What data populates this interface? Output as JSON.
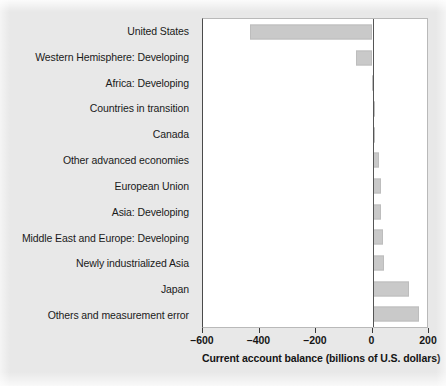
{
  "figure": {
    "background_color": "#e8e8e8",
    "plot_background_color": "#ffffff",
    "bar_color": "#c9c9c9",
    "axis_color": "#4a4a4a"
  },
  "chart_data": {
    "type": "bar",
    "orientation": "horizontal",
    "title": "",
    "xlabel": "Current account balance (billions of U.S. dollars)",
    "ylabel": "",
    "xlim": [
      -600,
      200
    ],
    "xticks": [
      -600,
      -400,
      -200,
      0,
      200
    ],
    "xtick_labels": [
      "–600",
      "–400",
      "–200",
      "0",
      "200"
    ],
    "grid": false,
    "legend": null,
    "zero_line": 0,
    "categories": [
      "United States",
      "Western Hemisphere: Developing",
      "Africa: Developing",
      "Countries in transition",
      "Canada",
      "Other advanced economies",
      "European Union",
      "Asia: Developing",
      "Middle East and Europe: Developing",
      "Newly industrialized Asia",
      "Japan",
      "Others and measurement error"
    ],
    "values": [
      -435,
      -58,
      -2,
      4,
      10,
      24,
      31,
      31,
      36,
      42,
      130,
      166
    ]
  }
}
